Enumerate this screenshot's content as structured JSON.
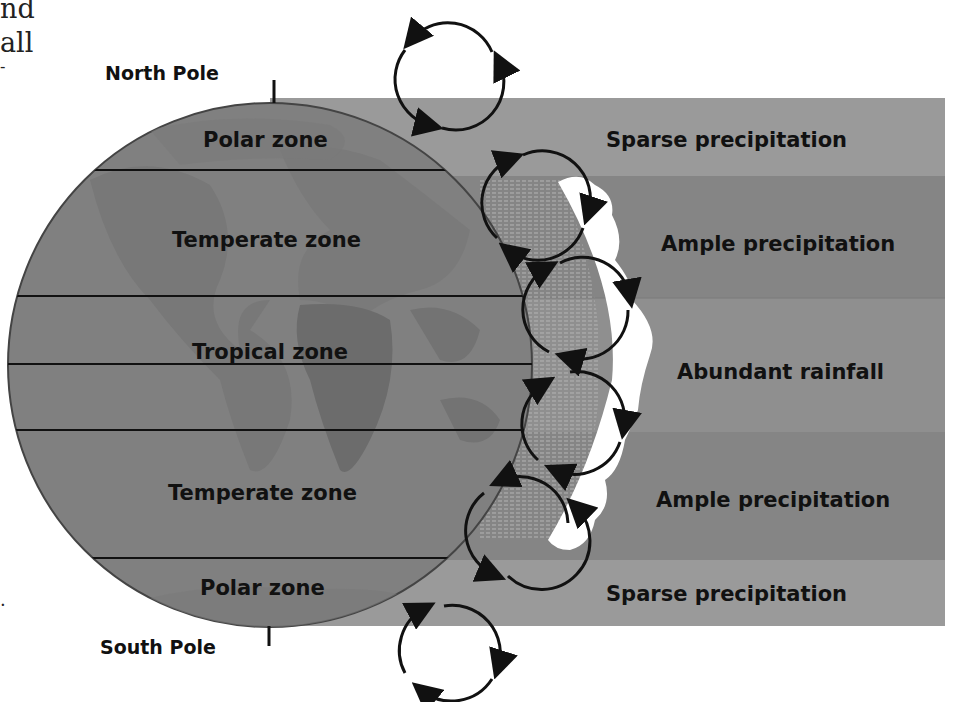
{
  "left_text_fragments": [
    "nd",
    "all",
    "-",
    "."
  ],
  "poles": {
    "north": "North Pole",
    "south": "South Pole"
  },
  "globe_zones": [
    {
      "label": "Polar zone"
    },
    {
      "label": "Temperate zone"
    },
    {
      "label": "Tropical zone"
    },
    {
      "label": "Temperate zone"
    },
    {
      "label": "Polar zone"
    }
  ],
  "precipitation_bands": [
    {
      "label": "Sparse precipitation",
      "color": "#9a9a9a"
    },
    {
      "label": "Ample precipitation",
      "color": "#858585"
    },
    {
      "label": "Abundant rainfall",
      "color": "#8f8f8f"
    },
    {
      "label": "Ample precipitation",
      "color": "#858585"
    },
    {
      "label": "Sparse precipitation",
      "color": "#9a9a9a"
    }
  ],
  "colors": {
    "globe": "#7f7f7f",
    "land": "#707070",
    "lines": "#111111",
    "clouds": "#ffffff"
  }
}
